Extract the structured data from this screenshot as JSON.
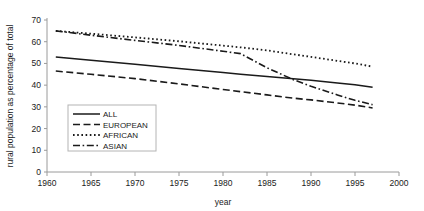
{
  "chart_data": {
    "type": "line",
    "title": "",
    "xlabel": "year",
    "ylabel": "rural population as percentage of total",
    "xlim": [
      1960,
      2000
    ],
    "ylim": [
      0,
      70
    ],
    "xticks": [
      "1960",
      "1965",
      "1970",
      "1975",
      "1980",
      "1985",
      "1990",
      "1995",
      "2000"
    ],
    "yticks": [
      "0",
      "10",
      "20",
      "30",
      "40",
      "50",
      "60",
      "70"
    ],
    "grid": false,
    "legend_position": "inside-lower-left",
    "x": [
      1961,
      1965,
      1970,
      1975,
      1980,
      1982,
      1985,
      1988,
      1990,
      1993,
      1995,
      1997
    ],
    "series": [
      {
        "name": "ALL",
        "style": "solid",
        "values": [
          53.0,
          51.5,
          49.6,
          47.7,
          45.8,
          45.0,
          44.0,
          43.0,
          42.3,
          41.0,
          40.2,
          39.0
        ]
      },
      {
        "name": "EUROPEAN",
        "style": "dashed",
        "values": [
          46.5,
          45.0,
          43.0,
          40.6,
          38.0,
          37.0,
          35.5,
          34.0,
          33.2,
          31.8,
          30.8,
          29.5
        ]
      },
      {
        "name": "AFRICAN",
        "style": "dotted",
        "values": [
          65.0,
          63.7,
          62.0,
          60.2,
          58.2,
          57.4,
          56.0,
          54.2,
          53.0,
          51.2,
          50.0,
          48.5
        ]
      },
      {
        "name": "ASIAN",
        "style": "dash-dot",
        "values": [
          65.0,
          63.0,
          60.6,
          58.3,
          55.6,
          54.5,
          48.0,
          42.5,
          39.5,
          35.5,
          33.0,
          31.0
        ]
      }
    ]
  },
  "legend": {
    "entries": [
      {
        "label": "ALL"
      },
      {
        "label": "EUROPEAN"
      },
      {
        "label": "AFRICAN"
      },
      {
        "label": "ASIAN"
      }
    ]
  },
  "colors": {
    "ink": "#1a1a1a",
    "axis": "#9a9a9a",
    "legend_border": "#b4b4b4",
    "background": "#ffffff"
  }
}
